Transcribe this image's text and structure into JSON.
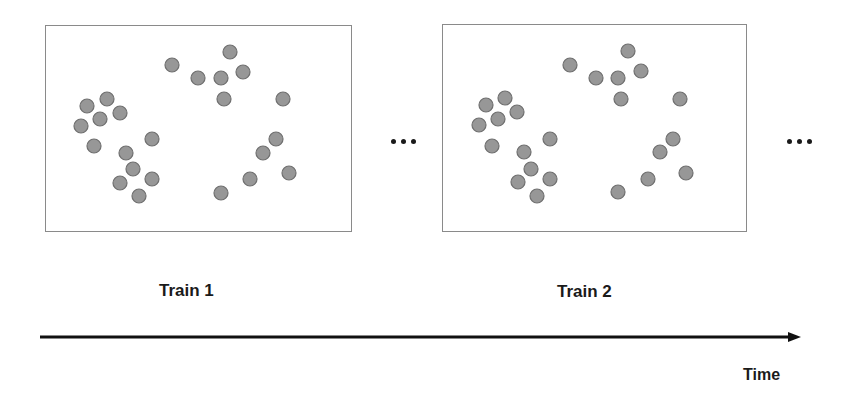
{
  "diagram": {
    "type": "time-series-of-frames",
    "frames": [
      {
        "label": "Train 1",
        "box": {
          "x": 45,
          "y": 25,
          "w": 307,
          "h": 207
        },
        "points": [
          [
            171,
            64
          ],
          [
            229,
            51
          ],
          [
            197,
            77
          ],
          [
            220,
            77
          ],
          [
            242,
            71
          ],
          [
            223,
            98
          ],
          [
            282,
            98
          ],
          [
            86,
            105
          ],
          [
            106,
            98
          ],
          [
            119,
            112
          ],
          [
            99,
            118
          ],
          [
            80,
            125
          ],
          [
            151,
            138
          ],
          [
            93,
            145
          ],
          [
            125,
            152
          ],
          [
            132,
            168
          ],
          [
            119,
            182
          ],
          [
            151,
            178
          ],
          [
            138,
            195
          ],
          [
            220,
            192
          ],
          [
            249,
            178
          ],
          [
            275,
            138
          ],
          [
            262,
            152
          ],
          [
            288,
            172
          ]
        ]
      },
      {
        "label": "Train 2",
        "box": {
          "x": 442,
          "y": 24,
          "w": 305,
          "h": 208
        },
        "points": [
          [
            569,
            64
          ],
          [
            627,
            50
          ],
          [
            595,
            77
          ],
          [
            617,
            77
          ],
          [
            640,
            70
          ],
          [
            620,
            98
          ],
          [
            679,
            98
          ],
          [
            485,
            104
          ],
          [
            504,
            97
          ],
          [
            516,
            111
          ],
          [
            497,
            118
          ],
          [
            478,
            124
          ],
          [
            549,
            138
          ],
          [
            491,
            145
          ],
          [
            523,
            151
          ],
          [
            530,
            168
          ],
          [
            517,
            181
          ],
          [
            549,
            178
          ],
          [
            536,
            195
          ],
          [
            617,
            191
          ],
          [
            647,
            178
          ],
          [
            672,
            138
          ],
          [
            659,
            151
          ],
          [
            685,
            172
          ]
        ]
      }
    ],
    "ellipsis": [
      "...",
      "..."
    ],
    "axis": {
      "label": "Time",
      "direction": "left-to-right"
    },
    "colors": {
      "point_fill": "#979797",
      "point_stroke": "#6f6f6f",
      "box_border": "#8a8a8a",
      "axis": "#111111",
      "text": "#1a1a1a"
    },
    "point_radius": 7
  }
}
